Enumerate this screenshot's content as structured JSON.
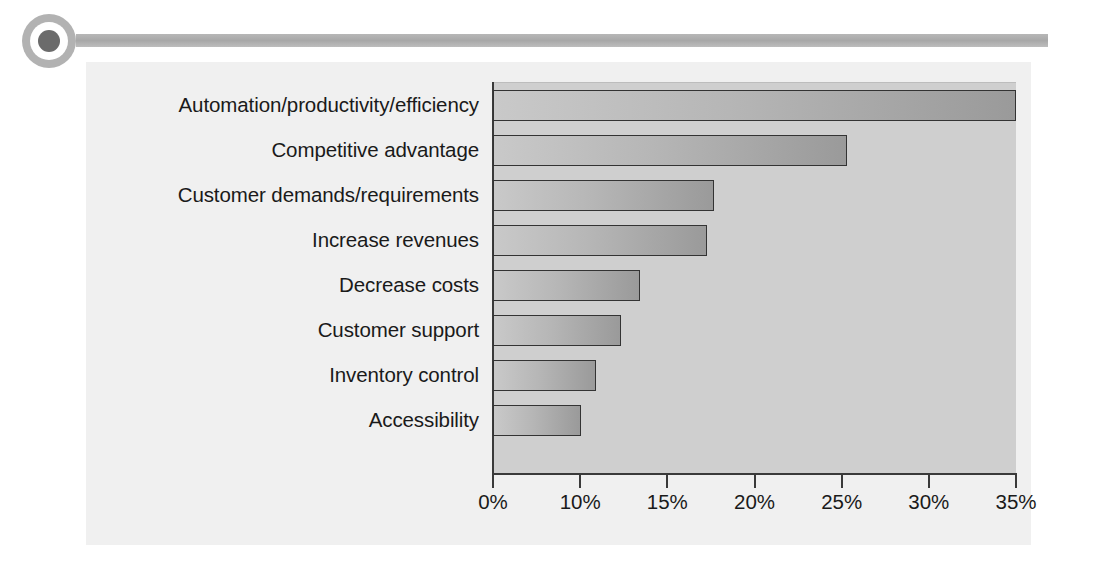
{
  "header": {
    "bullet_icon": "circle-bullet-icon",
    "rule_icon": "horizontal-rule-decoration"
  },
  "chart_data": {
    "type": "bar",
    "orientation": "horizontal",
    "title": "",
    "subtitle": "",
    "xlabel": "",
    "ylabel": "",
    "grid": false,
    "legend": null,
    "categories": [
      "Automation/productivity/efficiency",
      "Competitive advantage",
      "Customer demands/requirements",
      "Increase revenues",
      "Decrease costs",
      "Customer support",
      "Inventory control",
      "Accessibility"
    ],
    "values": [
      35.5,
      24.0,
      15.0,
      14.5,
      10.0,
      8.7,
      7.0,
      6.0
    ],
    "value_unit": "%",
    "xticklabels": [
      "0%",
      "10%",
      "15%",
      "20%",
      "25%",
      "30%",
      "35%"
    ],
    "xtick_values": [
      0,
      10,
      15,
      20,
      25,
      30,
      35
    ],
    "xlim": [
      0,
      35.5
    ],
    "bar_color": "#b6b6b6",
    "bar_border_color": "#333333",
    "plot_background": "#cfcfcf",
    "panel_background": "#f0f0f0",
    "text_color": "#1a1a1a"
  }
}
